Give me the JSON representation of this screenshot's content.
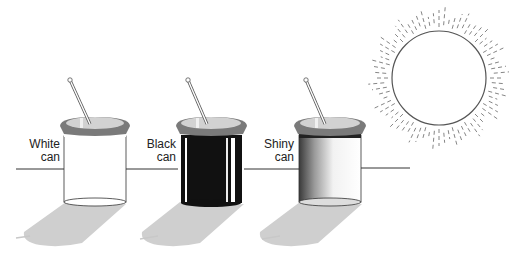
{
  "diagram": {
    "cans": [
      {
        "id": "white",
        "label_line1": "White",
        "label_line2": "can",
        "color": "#ffffff"
      },
      {
        "id": "black",
        "label_line1": "Black",
        "label_line2": "can",
        "color": "#111111"
      },
      {
        "id": "shiny",
        "label_line1": "Shiny",
        "label_line2": "can",
        "color": "#bdbdbd"
      }
    ],
    "light_source": "sun",
    "instrument": "thermometer",
    "colors": {
      "lid": "#7a7a7a",
      "shadow": "#cfcfcf",
      "line": "#333333"
    }
  }
}
